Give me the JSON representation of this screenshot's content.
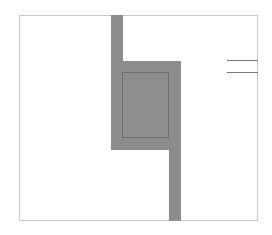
{
  "diagram": {
    "type": "layout-schematic",
    "colors": {
      "background": "#ffffff",
      "frame": "#c8c8c8",
      "fill": "#8c8c8c",
      "inner_fill": "#8e8e8e",
      "inner_outline": "#6e6e6e",
      "lines": "#7a7a7a"
    },
    "frame": {
      "x": 19,
      "y": 15,
      "w": 239,
      "h": 206
    },
    "upper_bar": {
      "x": 111,
      "y": 15,
      "w": 12,
      "h": 135
    },
    "block": {
      "x": 111,
      "y": 61,
      "w": 68,
      "h": 89
    },
    "lower_bar": {
      "x": 169,
      "y": 61,
      "w": 12,
      "h": 160
    },
    "inner_rect": {
      "x": 122,
      "y": 72,
      "w": 47,
      "h": 66
    },
    "right_lines": [
      {
        "x": 227,
        "y": 60,
        "w": 31
      },
      {
        "x": 227,
        "y": 72,
        "w": 31
      }
    ]
  }
}
